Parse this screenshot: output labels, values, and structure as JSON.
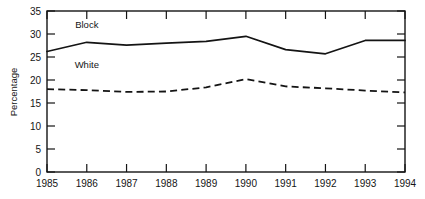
{
  "chart_data": {
    "type": "line",
    "title": "",
    "xlabel": "",
    "ylabel": "Percentage",
    "x": [
      1985,
      1986,
      1987,
      1988,
      1989,
      1990,
      1991,
      1992,
      1993,
      1994
    ],
    "xtick_labels": [
      "1985",
      "1986",
      "1987",
      "1988",
      "1989",
      "1990",
      "1991",
      "1992",
      "1993",
      "1994"
    ],
    "ytick_labels": [
      "0",
      "5",
      "10",
      "15",
      "20",
      "25",
      "30",
      "35"
    ],
    "ytick_values": [
      0,
      5,
      10,
      15,
      20,
      25,
      30,
      35
    ],
    "ylim": [
      0,
      35
    ],
    "xlim": [
      1985,
      1994
    ],
    "grid": false,
    "legend_position": "inline-annotation",
    "series": [
      {
        "name": "Block",
        "style": "solid",
        "color": "#141414",
        "label_x": 1986.0,
        "label_y": 31.4,
        "values": [
          26.2,
          28.2,
          27.6,
          28.0,
          28.4,
          29.5,
          26.6,
          25.7,
          28.6,
          28.6
        ]
      },
      {
        "name": "White",
        "style": "dashed",
        "color": "#141414",
        "label_x": 1986.0,
        "label_y": 22.6,
        "values": [
          18.0,
          17.8,
          17.4,
          17.5,
          18.4,
          20.2,
          18.6,
          18.2,
          17.7,
          17.3
        ]
      }
    ]
  }
}
